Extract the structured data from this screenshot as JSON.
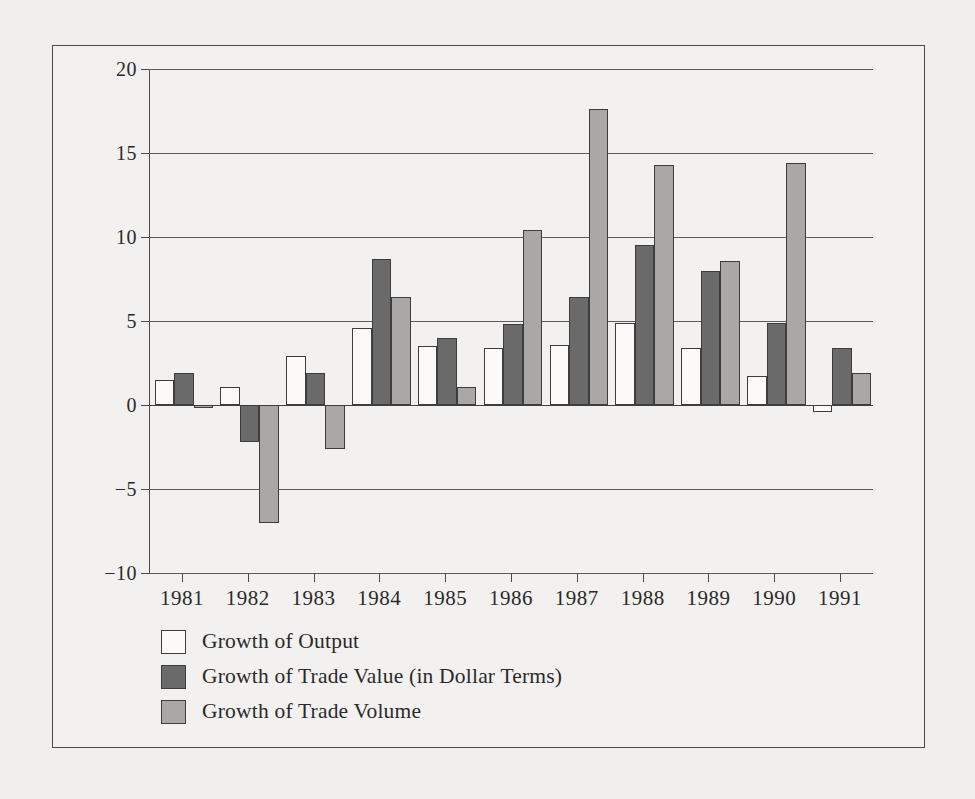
{
  "figure": {
    "background_color": "#f0efed",
    "frame_border_color": "#4a4a4a"
  },
  "colors": {
    "output": "#fbfaf8",
    "trade_value": "#6a6a6a",
    "trade_volume": "#a9a8a6",
    "bar_outline": "#3d3d3d",
    "gridline": "#5b5b5b",
    "axis": "#4a4a4a",
    "text": "#2a2a2a"
  },
  "legend": {
    "position": "below-axis-left",
    "items": [
      {
        "label": "Growth of Output",
        "swatch": "output"
      },
      {
        "label": "Growth of Trade Value (in Dollar Terms)",
        "swatch": "trade_value"
      },
      {
        "label": "Growth of Trade Volume",
        "swatch": "trade_volume"
      }
    ]
  },
  "chart_data": {
    "type": "bar",
    "title": "",
    "subtitle": "",
    "xlabel": "",
    "ylabel": "",
    "grid": true,
    "legend_position": "bottom-left",
    "categories": [
      "1981",
      "1982",
      "1983",
      "1984",
      "1985",
      "1986",
      "1987",
      "1988",
      "1989",
      "1990",
      "1991"
    ],
    "ylim": [
      -10,
      20
    ],
    "yticks": [
      -10,
      -5,
      0,
      5,
      10,
      15,
      20
    ],
    "ytick_labels": [
      "−10",
      "−5",
      "0",
      "5",
      "10",
      "15",
      "20"
    ],
    "series": [
      {
        "name": "Growth of Output",
        "color": "#fbfaf8",
        "values": [
          1.5,
          1.1,
          2.9,
          4.6,
          3.5,
          3.4,
          3.6,
          4.9,
          3.4,
          1.7,
          -0.4
        ]
      },
      {
        "name": "Growth of Trade Value (in Dollar Terms)",
        "color": "#6a6a6a",
        "values": [
          1.9,
          -2.2,
          1.9,
          8.7,
          4.0,
          4.8,
          6.4,
          9.5,
          8.0,
          4.9,
          3.4
        ]
      },
      {
        "name": "Growth of Trade Volume",
        "color": "#a9a8a6",
        "values": [
          -0.2,
          -7.0,
          -2.6,
          6.4,
          1.1,
          10.4,
          17.6,
          14.3,
          8.6,
          14.4,
          1.9
        ]
      }
    ]
  }
}
